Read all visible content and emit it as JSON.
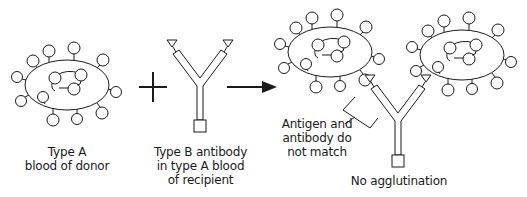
{
  "diagram": {
    "colors": {
      "stroke": "#1a1a1a",
      "background": "#ffffff"
    },
    "panels": [
      {
        "id": "donor-blood",
        "label_lines": [
          "Type A",
          "blood of donor"
        ]
      },
      {
        "id": "recipient-antibody",
        "label_lines": [
          "Type B antibody",
          "in type A blood",
          "of recipient"
        ]
      },
      {
        "id": "result",
        "callout_lines": [
          "Antigen and",
          "antibody do",
          "not match"
        ],
        "label_lines": [
          "No agglutination"
        ]
      }
    ],
    "operators": {
      "plus": "+",
      "arrow": "→"
    }
  }
}
